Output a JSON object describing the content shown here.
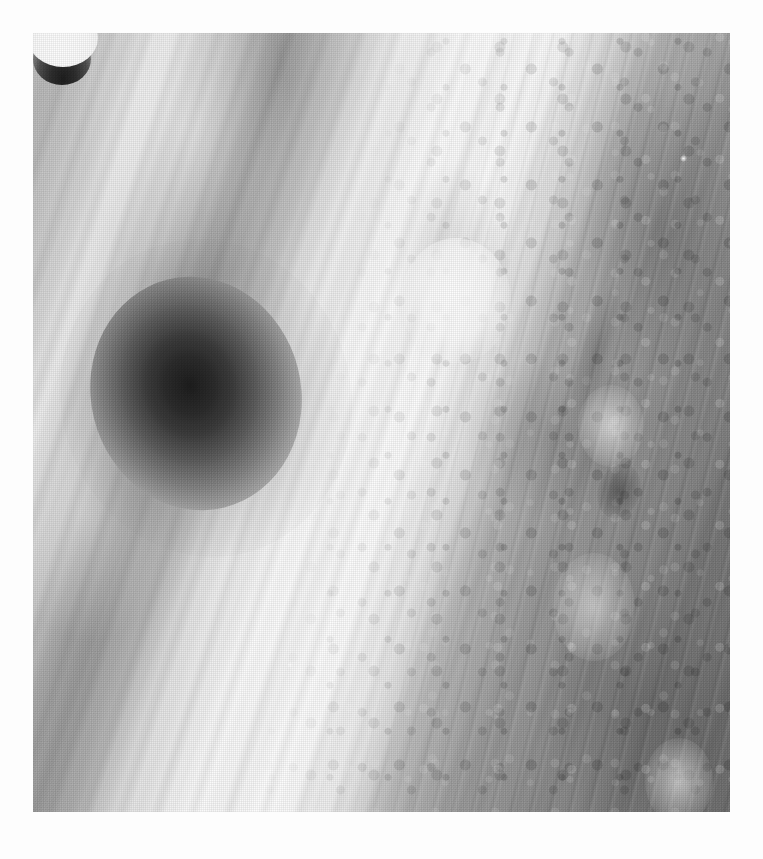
{
  "page": {
    "background_color": "#fdfdfd",
    "width": 763,
    "height": 859,
    "ghost_text_fragments": [
      "",
      "",
      ""
    ]
  },
  "photograph": {
    "name": "jupiter-cloud-bands-photograph",
    "kind": "scanned halftone grayscale astronomical photograph",
    "alt_text": "Close-up grayscale image of Jupiter's cloud bands showing a large diffuse dark impact spot at left, a small dark crescent feature near centre, and turbulent banded cloud texture with bright ovals at right",
    "bounds": {
      "left": 33,
      "top": 33,
      "width": 697,
      "height": 779
    },
    "orientation_note": "cloud bands run diagonally from upper-left to lower-right",
    "tone_range": {
      "darkest": "#1d1d1d",
      "lightest": "#fefefe",
      "midtone": "#b9b9b9"
    },
    "features": [
      {
        "id": "impact-spot",
        "label": "large diffuse dark spot",
        "center": [
          163,
          360
        ],
        "size": [
          210,
          235
        ],
        "tone": "#1d1d1d"
      },
      {
        "id": "impact-spot-halo",
        "label": "dark spot outer halo",
        "center": [
          173,
          365
        ],
        "size": [
          290,
          320
        ],
        "tone": "#5a5a5a"
      },
      {
        "id": "crescent-feature",
        "label": "small dark crescent",
        "center": [
          430,
          274
        ],
        "size": [
          58,
          52
        ],
        "tone": "#1e1e1e"
      },
      {
        "id": "crescent-bright",
        "label": "bright halo around crescent",
        "center": [
          423,
          267
        ],
        "size": [
          110,
          125
        ],
        "tone": "#ffffff"
      },
      {
        "id": "oval-upper",
        "label": "bright oval in belt (upper)",
        "center": [
          578,
          393
        ],
        "size": [
          66,
          82
        ],
        "tone": "#ffffff"
      },
      {
        "id": "oval-mid",
        "label": "bright oval in belt (middle)",
        "center": [
          561,
          574
        ],
        "size": [
          82,
          108
        ],
        "tone": "#ffffff"
      },
      {
        "id": "oval-lower",
        "label": "bright oval in belt (lower)",
        "center": [
          646,
          748
        ],
        "size": [
          68,
          86
        ],
        "tone": "#ffffff"
      },
      {
        "id": "dark-knot",
        "label": "dark turbulent knot",
        "center": [
          586,
          458
        ],
        "size": [
          42,
          56
        ],
        "tone": "#2a2a2a"
      },
      {
        "id": "dark-filament",
        "label": "dark filament streak",
        "center": [
          563,
          320
        ],
        "size": [
          36,
          150
        ],
        "tone": "#555555"
      },
      {
        "id": "bright-speck-a",
        "label": "bright point speck (upper right)",
        "center": [
          650,
          125
        ],
        "size": [
          7,
          7
        ],
        "tone": "#ffffff"
      },
      {
        "id": "bright-speck-b",
        "label": "bright point speck (lower left)",
        "center": [
          257,
          632
        ],
        "size": [
          6,
          6
        ],
        "tone": "#ffffff"
      }
    ],
    "zones": [
      {
        "id": "bright-zone",
        "label": "bright cloud zone",
        "approx_x_range": [
          240,
          430
        ],
        "tone": "#fefefe"
      },
      {
        "id": "dark-belt",
        "label": "dark turbulent belt",
        "approx_x_range": [
          470,
          730
        ],
        "tone": "#707070"
      },
      {
        "id": "left-bands",
        "label": "striated left bands",
        "approx_x_range": [
          33,
          240
        ],
        "tone": "#bdbdbd"
      }
    ]
  }
}
